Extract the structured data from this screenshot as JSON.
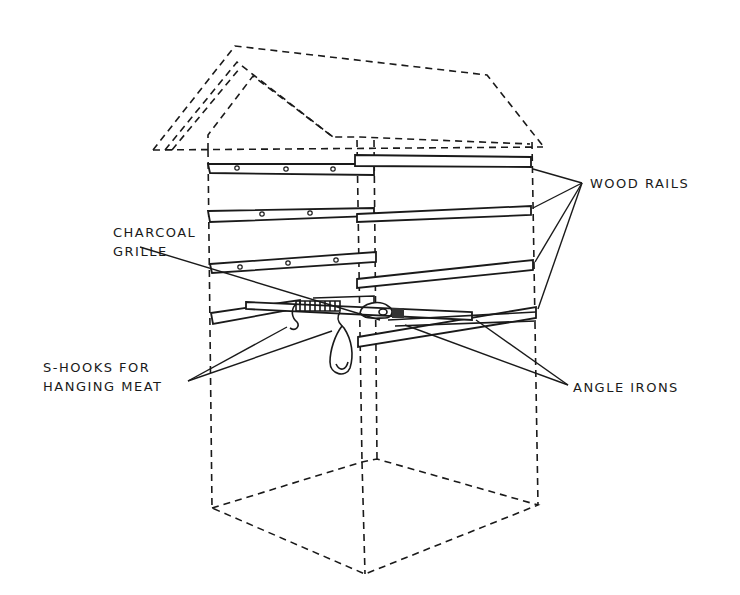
{
  "diagram": {
    "background_color": "#ffffff",
    "ink_color": "#1a1a1a",
    "labels": {
      "wood_rails": "WOOD RAILS",
      "charcoal_grille_line1": "CHARCOAL",
      "charcoal_grille_line2": "GRILLE",
      "s_hooks_line1": "S-HOOKS FOR",
      "s_hooks_line2": "HANGING MEAT",
      "angle_irons": "ANGLE IRONS"
    },
    "components": [
      {
        "name": "roof",
        "style": "dashed"
      },
      {
        "name": "house-body",
        "style": "dashed"
      },
      {
        "name": "wood-rails-left",
        "count": 3
      },
      {
        "name": "wood-rails-right",
        "count": 4
      },
      {
        "name": "angle-irons",
        "count": 2
      },
      {
        "name": "charcoal-grille"
      },
      {
        "name": "s-hooks",
        "count": 2
      },
      {
        "name": "hanging-meat"
      }
    ]
  }
}
